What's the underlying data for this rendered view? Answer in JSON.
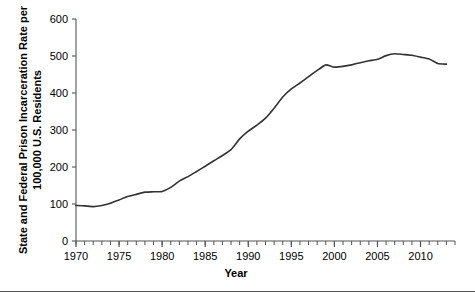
{
  "chart_data": {
    "type": "line",
    "title": "",
    "subtitle": "",
    "xlabel": "Year",
    "ylabel": "State and Federal Prison Incarceration Rate per 100,000 U.S. Residents",
    "ylabel_line1": "State and Federal Prison Incarceration Rate per",
    "ylabel_line2": "100,000 U.S. Residents",
    "xlim": [
      1970,
      2014
    ],
    "ylim": [
      0,
      600
    ],
    "x_ticks_major": [
      1970,
      1975,
      1980,
      1985,
      1990,
      1995,
      2000,
      2005,
      2010
    ],
    "x_tick_labels": [
      "1970",
      "1975",
      "1980",
      "1985",
      "1990",
      "1995",
      "2000",
      "2005",
      "2010"
    ],
    "x_minor_tick_interval": 1,
    "y_ticks": [
      0,
      100,
      200,
      300,
      400,
      500,
      600
    ],
    "y_tick_labels": [
      "0",
      "100",
      "200",
      "300",
      "400",
      "500",
      "600"
    ],
    "grid": false,
    "legend": false,
    "legend_position": "none",
    "line_color": "#333333",
    "line_width": 1.6,
    "axis_color": "#555555",
    "series": [
      {
        "name": "State and Federal Prison Incarceration Rate",
        "x": [
          1970,
          1971,
          1972,
          1973,
          1974,
          1975,
          1976,
          1977,
          1978,
          1979,
          1980,
          1981,
          1982,
          1983,
          1984,
          1985,
          1986,
          1987,
          1988,
          1989,
          1990,
          1991,
          1992,
          1993,
          1994,
          1995,
          1996,
          1997,
          1998,
          1999,
          2000,
          2001,
          2002,
          2003,
          2004,
          2005,
          2006,
          2007,
          2008,
          2009,
          2010,
          2011,
          2012,
          2013
        ],
        "values": [
          96,
          95,
          93,
          96,
          102,
          111,
          120,
          126,
          132,
          133,
          134,
          145,
          162,
          174,
          188,
          202,
          217,
          231,
          247,
          276,
          297,
          313,
          332,
          359,
          389,
          411,
          427,
          444,
          461,
          476,
          470,
          472,
          476,
          482,
          487,
          491,
          501,
          506,
          504,
          502,
          497,
          492,
          480,
          478
        ]
      }
    ]
  },
  "footer": {
    "rule": ""
  }
}
